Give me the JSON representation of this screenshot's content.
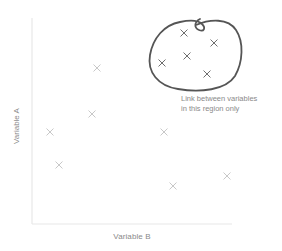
{
  "diagram": {
    "type": "scatter-concept-diagram",
    "x_axis_label": "Variable B",
    "y_axis_label": "Variable A",
    "annotation": {
      "line1": "Link between variables",
      "line2": "in this region only"
    },
    "colors": {
      "axis": "#e6e6e6",
      "marker": "#c8c8c8",
      "marker_in_region": "#6e6e6e",
      "region_outline": "#555555",
      "label_text": "#8a8a8a"
    },
    "points_outside_region": [
      {
        "x": 97,
        "y": 68
      },
      {
        "x": 92,
        "y": 114
      },
      {
        "x": 50,
        "y": 132
      },
      {
        "x": 59,
        "y": 165
      },
      {
        "x": 164,
        "y": 132
      },
      {
        "x": 227,
        "y": 176
      },
      {
        "x": 173,
        "y": 186
      }
    ],
    "points_inside_region": [
      {
        "x": 184,
        "y": 33
      },
      {
        "x": 214,
        "y": 43
      },
      {
        "x": 187,
        "y": 56
      },
      {
        "x": 162,
        "y": 63
      },
      {
        "x": 207,
        "y": 74
      }
    ]
  }
}
